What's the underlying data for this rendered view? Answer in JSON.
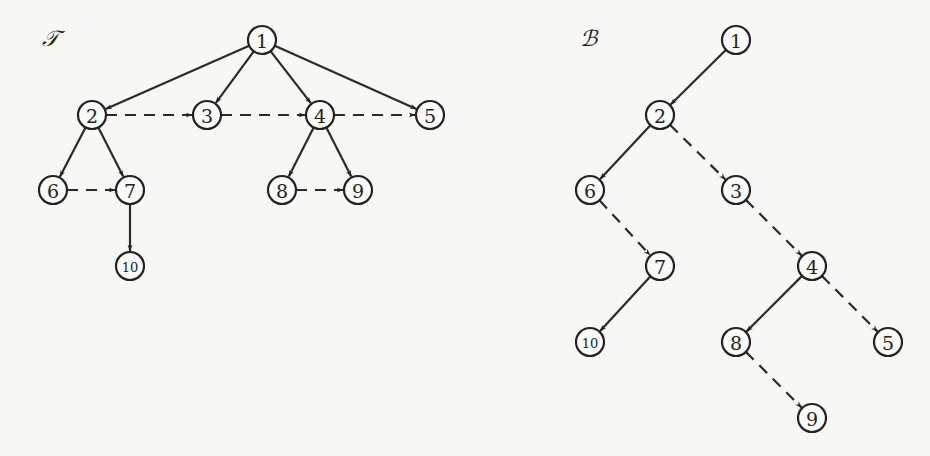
{
  "diagram": {
    "trees": [
      {
        "id": "T",
        "label": "𝒯",
        "label_pos": [
          42,
          46
        ],
        "nodes": [
          {
            "id": "1",
            "x": 262,
            "y": 40
          },
          {
            "id": "2",
            "x": 92,
            "y": 115
          },
          {
            "id": "3",
            "x": 207,
            "y": 115
          },
          {
            "id": "4",
            "x": 320,
            "y": 115
          },
          {
            "id": "5",
            "x": 430,
            "y": 115
          },
          {
            "id": "6",
            "x": 53,
            "y": 190
          },
          {
            "id": "7",
            "x": 130,
            "y": 190
          },
          {
            "id": "8",
            "x": 282,
            "y": 190
          },
          {
            "id": "9",
            "x": 358,
            "y": 190
          },
          {
            "id": "10",
            "x": 130,
            "y": 266
          }
        ],
        "edges": [
          {
            "from": "1",
            "to": "2",
            "style": "solid"
          },
          {
            "from": "1",
            "to": "3",
            "style": "solid"
          },
          {
            "from": "1",
            "to": "4",
            "style": "solid"
          },
          {
            "from": "1",
            "to": "5",
            "style": "solid"
          },
          {
            "from": "2",
            "to": "3",
            "style": "dashed"
          },
          {
            "from": "3",
            "to": "4",
            "style": "dashed"
          },
          {
            "from": "4",
            "to": "5",
            "style": "dashed"
          },
          {
            "from": "2",
            "to": "6",
            "style": "solid"
          },
          {
            "from": "2",
            "to": "7",
            "style": "solid"
          },
          {
            "from": "6",
            "to": "7",
            "style": "dashed"
          },
          {
            "from": "4",
            "to": "8",
            "style": "solid"
          },
          {
            "from": "4",
            "to": "9",
            "style": "solid"
          },
          {
            "from": "8",
            "to": "9",
            "style": "dashed"
          },
          {
            "from": "7",
            "to": "10",
            "style": "solid"
          }
        ]
      },
      {
        "id": "B",
        "label": "ℬ",
        "label_pos": [
          580,
          46
        ],
        "nodes": [
          {
            "id": "1",
            "x": 736,
            "y": 40
          },
          {
            "id": "2",
            "x": 660,
            "y": 115
          },
          {
            "id": "6",
            "x": 590,
            "y": 190
          },
          {
            "id": "3",
            "x": 736,
            "y": 190
          },
          {
            "id": "7",
            "x": 660,
            "y": 266
          },
          {
            "id": "4",
            "x": 812,
            "y": 266
          },
          {
            "id": "10",
            "x": 590,
            "y": 342
          },
          {
            "id": "8",
            "x": 736,
            "y": 342
          },
          {
            "id": "5",
            "x": 888,
            "y": 342
          },
          {
            "id": "9",
            "x": 812,
            "y": 418
          }
        ],
        "edges": [
          {
            "from": "1",
            "to": "2",
            "style": "solid"
          },
          {
            "from": "2",
            "to": "6",
            "style": "solid"
          },
          {
            "from": "2",
            "to": "3",
            "style": "dashed"
          },
          {
            "from": "6",
            "to": "7",
            "style": "dashed"
          },
          {
            "from": "3",
            "to": "4",
            "style": "dashed"
          },
          {
            "from": "7",
            "to": "10",
            "style": "solid"
          },
          {
            "from": "4",
            "to": "8",
            "style": "solid"
          },
          {
            "from": "4",
            "to": "5",
            "style": "dashed"
          },
          {
            "from": "8",
            "to": "9",
            "style": "dashed"
          }
        ]
      }
    ],
    "node_radius": 14,
    "colors": {
      "stroke": "#222222",
      "background": "#f7f7f5"
    }
  }
}
